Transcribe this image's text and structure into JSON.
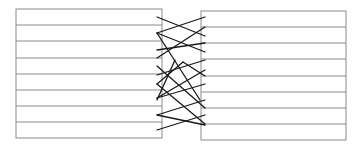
{
  "diagram": {
    "width": 361,
    "height": 147,
    "colors": {
      "box_stroke": "#8a8a8a",
      "cross_stroke": "#1a1a1a",
      "background": "#ffffff"
    },
    "left_box": {
      "x": 16,
      "y": 9,
      "width": 146,
      "height": 129,
      "row_lines_y": [
        25,
        41,
        58,
        74,
        90,
        106,
        122
      ]
    },
    "right_box": {
      "x": 201,
      "y": 11,
      "width": 145,
      "height": 129,
      "row_lines_y": [
        27,
        43,
        59,
        76,
        92,
        108,
        124
      ]
    },
    "crossing_lines": [
      [
        157,
        17,
        205,
        36
      ],
      [
        157,
        33,
        205,
        17
      ],
      [
        157,
        33,
        205,
        52
      ],
      [
        157,
        33,
        200,
        100
      ],
      [
        157,
        50,
        205,
        43
      ],
      [
        157,
        58,
        205,
        27
      ],
      [
        157,
        66,
        205,
        108
      ],
      [
        157,
        75,
        205,
        60
      ],
      [
        157,
        84,
        205,
        124
      ],
      [
        157,
        98,
        205,
        84
      ],
      [
        157,
        98,
        205,
        70
      ],
      [
        157,
        100,
        175,
        60
      ],
      [
        157,
        115,
        205,
        100
      ],
      [
        157,
        115,
        205,
        125
      ],
      [
        157,
        130,
        205,
        115
      ],
      [
        157,
        84,
        183,
        62
      ],
      [
        183,
        62,
        205,
        76
      ]
    ]
  }
}
